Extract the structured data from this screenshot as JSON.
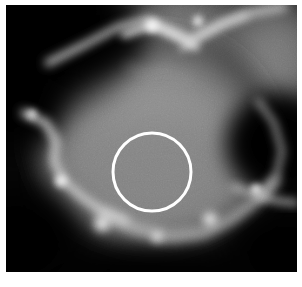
{
  "figure": {
    "kind": "grayscale-micrograph",
    "caption": "",
    "width_px": 302,
    "height_px": 287,
    "background_color": "#ffffff"
  },
  "image": {
    "alt_text": "Grayscale micrograph of a cell-like region with bright membrane ridges, bright puncta and dark extracellular areas",
    "frame": {
      "left_px": 6,
      "top_px": 5,
      "width_px": 291,
      "height_px": 267
    },
    "colormap": "grayscale",
    "min_gray": "#000000",
    "max_gray": "#ffffff",
    "base_fill": "#050505",
    "noise_opacity": 0.14,
    "regions": [
      {
        "name": "cell-body-interior",
        "kind": "radial-blob",
        "cx_pct": 50,
        "cy_pct": 50,
        "rx_pct": 42,
        "ry_pct": 40,
        "color": "#8f8f8f",
        "edge_color": "#1a1a1a",
        "opacity": 1.0
      },
      {
        "name": "upper-mid-gray-field",
        "kind": "radial-blob",
        "cx_pct": 62,
        "cy_pct": 22,
        "rx_pct": 44,
        "ry_pct": 33,
        "color": "#8a8a8a",
        "edge_color": "#0d0d0d",
        "opacity": 0.95
      },
      {
        "name": "right-mid-gray-field",
        "kind": "radial-blob",
        "cx_pct": 92,
        "cy_pct": 20,
        "rx_pct": 22,
        "ry_pct": 26,
        "color": "#7d7d7d",
        "edge_color": "#101010",
        "opacity": 0.9
      },
      {
        "name": "dark-top-left-corner",
        "kind": "radial-blob",
        "cx_pct": 10,
        "cy_pct": 8,
        "rx_pct": 36,
        "ry_pct": 34,
        "color": "#000000",
        "edge_color": "#000000",
        "opacity": 1.0
      },
      {
        "name": "dark-left-lobe",
        "kind": "radial-blob",
        "cx_pct": 3,
        "cy_pct": 36,
        "rx_pct": 20,
        "ry_pct": 22,
        "color": "#000000",
        "edge_color": "#000000",
        "opacity": 1.0
      },
      {
        "name": "dark-bottom-left-corner",
        "kind": "radial-blob",
        "cx_pct": 4,
        "cy_pct": 88,
        "rx_pct": 26,
        "ry_pct": 24,
        "color": "#000000",
        "edge_color": "#000000",
        "opacity": 1.0
      },
      {
        "name": "dark-right-vacuole",
        "kind": "radial-blob",
        "cx_pct": 93,
        "cy_pct": 52,
        "rx_pct": 21,
        "ry_pct": 22,
        "color": "#000000",
        "edge_color": "#000000",
        "opacity": 1.0
      },
      {
        "name": "dark-bottom-right-corner",
        "kind": "radial-blob",
        "cx_pct": 96,
        "cy_pct": 93,
        "rx_pct": 24,
        "ry_pct": 20,
        "color": "#000000",
        "edge_color": "#000000",
        "opacity": 1.0
      },
      {
        "name": "dark-bottom-band",
        "kind": "radial-blob",
        "cx_pct": 48,
        "cy_pct": 102,
        "rx_pct": 46,
        "ry_pct": 11,
        "color": "#050505",
        "edge_color": "#050505",
        "opacity": 1.0
      }
    ],
    "ridges": [
      {
        "name": "top-membrane-ridge",
        "points": "42,58 78,40 112,22 142,14 162,24 186,34 214,20 246,8 278,2",
        "width": 7,
        "color": "#d8d8d8",
        "blur": 5,
        "opacity": 0.85
      },
      {
        "name": "top-bright-arc",
        "points": "118,30 146,20 168,30 190,42",
        "width": 6,
        "color": "#ffffff",
        "blur": 4,
        "opacity": 0.95
      },
      {
        "name": "top-right-branch",
        "points": "176,44 196,30 218,18 240,10",
        "width": 5,
        "color": "#e8e8e8",
        "blur": 4,
        "opacity": 0.8
      },
      {
        "name": "left-membrane-ridge",
        "points": "18,108 40,118 50,136 48,156 58,176 76,192 96,206 120,216",
        "width": 7,
        "color": "#e2e2e2",
        "blur": 5,
        "opacity": 0.9
      },
      {
        "name": "bottom-membrane-ridge",
        "points": "96,208 130,224 164,232 198,228 226,214 250,196 270,176",
        "width": 8,
        "color": "#d4d4d4",
        "blur": 6,
        "opacity": 0.85
      },
      {
        "name": "right-membrane-ridge",
        "points": "252,96 268,118 276,146 270,172 254,192",
        "width": 6,
        "color": "#c8c8c8",
        "blur": 5,
        "opacity": 0.7
      },
      {
        "name": "right-lower-ridge",
        "points": "228,182 250,190 272,196 290,198",
        "width": 6,
        "color": "#d0d0d0",
        "blur": 5,
        "opacity": 0.8
      }
    ],
    "puncta": [
      {
        "name": "punctum-left-lower",
        "cx_pct": 19,
        "cy_pct": 66,
        "r_px": 7,
        "color": "#ffffff",
        "blur": 4
      },
      {
        "name": "punctum-left-upper",
        "cx_pct": 9,
        "cy_pct": 41,
        "r_px": 5,
        "color": "#f0f0f0",
        "blur": 4
      },
      {
        "name": "punctum-bottom-left",
        "cx_pct": 33,
        "cy_pct": 82,
        "r_px": 9,
        "color": "#ffffff",
        "blur": 5
      },
      {
        "name": "punctum-bottom-center",
        "cx_pct": 52,
        "cy_pct": 87,
        "r_px": 6,
        "color": "#e8e8e8",
        "blur": 5
      },
      {
        "name": "punctum-bottom-right",
        "cx_pct": 70,
        "cy_pct": 80,
        "r_px": 8,
        "color": "#ffffff",
        "blur": 5
      },
      {
        "name": "punctum-right-edge",
        "cx_pct": 86,
        "cy_pct": 69,
        "r_px": 6,
        "color": "#ffffff",
        "blur": 4
      },
      {
        "name": "punctum-top-center",
        "cx_pct": 50,
        "cy_pct": 8,
        "r_px": 8,
        "color": "#ffffff",
        "blur": 5
      },
      {
        "name": "punctum-top-right",
        "cx_pct": 66,
        "cy_pct": 6,
        "r_px": 6,
        "color": "#f4f4f4",
        "blur": 4
      }
    ]
  },
  "annotations": {
    "roi": {
      "name": "circular-roi",
      "shape": "circle",
      "label": "",
      "center_x_px": 146,
      "center_y_px": 167,
      "radius_px": 39,
      "stroke_color": "#ffffff",
      "stroke_width_px": 3,
      "fill": "none"
    }
  }
}
